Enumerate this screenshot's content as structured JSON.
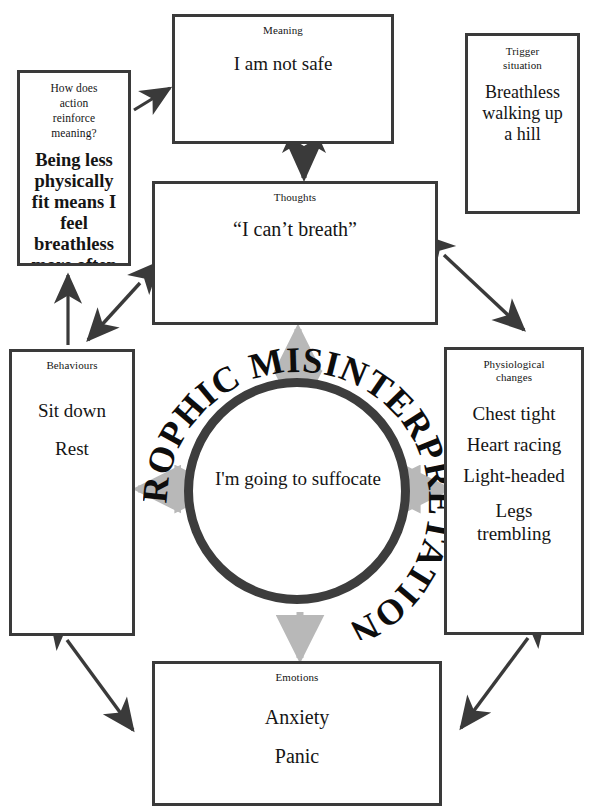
{
  "diagram": {
    "center": {
      "ring_text": "CATASTROPHIC MISINTERPRETATION",
      "core_text": "I'm going to suffocate"
    },
    "nodes": {
      "meaning": {
        "title": "Meaning",
        "lines": [
          "I am not safe"
        ]
      },
      "trigger": {
        "title_line1": "Trigger",
        "title_line2": "situation",
        "lines": [
          "Breathless",
          "walking up",
          "a hill"
        ]
      },
      "reinforce": {
        "title_line1": "How does",
        "title_line2": "action",
        "title_line3": "reinforce",
        "title_line4": "meaning?",
        "lines": [
          "Being less",
          "physically",
          "fit means I",
          "feel",
          "breathless",
          "more often"
        ]
      },
      "thoughts": {
        "title": "Thoughts",
        "lines": [
          "“I can’t breath”"
        ]
      },
      "behaviours": {
        "title": "Behaviours",
        "lines": [
          "Sit down",
          "Rest"
        ]
      },
      "physiological": {
        "title_line1": "Physiological",
        "title_line2": "changes",
        "lines": [
          "Chest tight",
          "Heart racing",
          "Light-headed"
        ],
        "last_line1": "Legs",
        "last_line2": "trembling"
      },
      "emotions": {
        "title": "Emotions",
        "lines": [
          "Anxiety",
          "Panic"
        ]
      }
    },
    "connectors": [
      {
        "name": "reinforce-to-meaning",
        "style": "single-head",
        "color": "#3a3a3a"
      },
      {
        "name": "meaning-thoughts",
        "style": "double-head",
        "color": "#3a3a3a"
      },
      {
        "name": "thoughts-physiological",
        "style": "double-head",
        "color": "#3a3a3a"
      },
      {
        "name": "thoughts-behaviours",
        "style": "double-head",
        "color": "#3a3a3a"
      },
      {
        "name": "behaviours-to-reinforce",
        "style": "single-head",
        "color": "#3a3a3a"
      },
      {
        "name": "behaviours-emotions",
        "style": "double-head",
        "color": "#3a3a3a"
      },
      {
        "name": "physiological-emotions",
        "style": "double-head",
        "color": "#3a3a3a"
      },
      {
        "name": "ring-up",
        "style": "double-head",
        "color": "#b8b8b8"
      },
      {
        "name": "ring-left",
        "style": "double-head",
        "color": "#b8b8b8"
      },
      {
        "name": "ring-right",
        "style": "double-head",
        "color": "#b8b8b8"
      },
      {
        "name": "ring-down",
        "style": "single-head",
        "color": "#b8b8b8"
      }
    ],
    "colors": {
      "box_border": "#3a3a3a",
      "ring": "#3d3d3d",
      "arrow_dark": "#3a3a3a",
      "arrow_gray": "#b8b8b8",
      "text": "#151515",
      "background": "#ffffff"
    }
  }
}
